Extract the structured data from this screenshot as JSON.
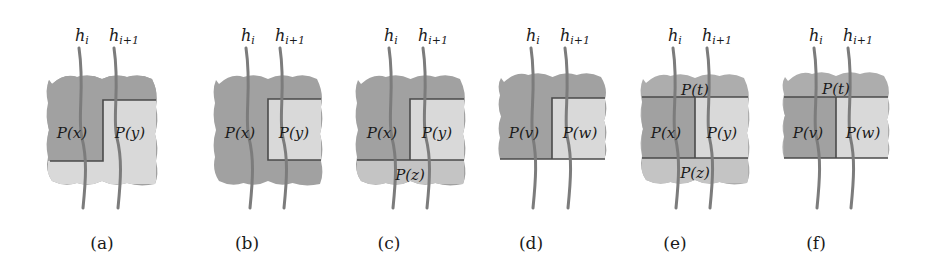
{
  "figure": {
    "colors": {
      "dark_region": "#a1a1a1",
      "mid_region": "#adadad",
      "light_region": "#d9d9d9",
      "lighter_region": "#c4c4c4",
      "boundary_line": "#4a4a4a",
      "curve": "#7c7c7c",
      "text": "#1a1a1a"
    },
    "curve_labels": {
      "left": "h",
      "left_sub": "i",
      "right": "h",
      "right_sub": "i+1"
    },
    "panels": [
      {
        "id": "a",
        "caption": "(a)",
        "cx": 102,
        "blob": {
          "x0": 48,
          "x1": 156,
          "y0": 76,
          "y1": 184,
          "top_wavy": true,
          "bottom_wavy": true
        },
        "regions": [
          {
            "label": "P(x)",
            "shade": "dark",
            "poly": [
              [
                48,
                76
              ],
              [
                156,
                76
              ],
              [
                156,
                100
              ],
              [
                103,
                100
              ],
              [
                103,
                161
              ],
              [
                48,
                161
              ]
            ],
            "text_xy": [
              72,
              133
            ]
          },
          {
            "label": "P(y)",
            "shade": "light",
            "poly": [
              [
                103,
                100
              ],
              [
                156,
                100
              ],
              [
                156,
                184
              ],
              [
                48,
                184
              ],
              [
                48,
                161
              ],
              [
                103,
                161
              ]
            ],
            "text_xy": [
              130,
              133
            ]
          }
        ],
        "lines": [
          [
            [
              50,
              161
            ],
            [
              103,
              161
            ],
            [
              103,
              100
            ],
            [
              156,
              100
            ]
          ]
        ]
      },
      {
        "id": "b",
        "caption": "(b)",
        "cx": 247,
        "blob": {
          "x0": 215,
          "x1": 321,
          "y0": 76,
          "y1": 184,
          "top_wavy": true,
          "bottom_wavy": true
        },
        "regions": [
          {
            "label": "P(x)",
            "shade": "dark",
            "poly": [],
            "text_xy": [
              240,
              133
            ]
          },
          {
            "label": "P(y)",
            "shade": "light",
            "poly": [
              [
                268,
                99
              ],
              [
                321,
                99
              ],
              [
                321,
                160
              ],
              [
                268,
                160
              ]
            ],
            "text_xy": [
              294,
              133
            ]
          }
        ],
        "lines": [
          [
            [
              321,
              99
            ],
            [
              268,
              99
            ],
            [
              268,
              160
            ],
            [
              321,
              160
            ]
          ]
        ]
      },
      {
        "id": "c",
        "caption": "(c)",
        "cx": 389,
        "blob": {
          "x0": 357,
          "x1": 464,
          "y0": 76,
          "y1": 184,
          "top_wavy": true,
          "bottom_wavy": true
        },
        "regions": [
          {
            "label": "P(x)",
            "shade": "dark",
            "poly": [],
            "text_xy": [
              382,
              133
            ]
          },
          {
            "label": "P(y)",
            "shade": "light",
            "poly": [
              [
                410,
                99
              ],
              [
                464,
                99
              ],
              [
                464,
                160
              ],
              [
                410,
                160
              ]
            ],
            "text_xy": [
              437,
              133
            ]
          },
          {
            "label": "P(z)",
            "shade": "lighter",
            "poly": [
              [
                357,
                160
              ],
              [
                464,
                160
              ],
              [
                464,
                184
              ],
              [
                357,
                184
              ]
            ],
            "text_xy": [
              410,
              175
            ]
          }
        ],
        "lines": [
          [
            [
              464,
              99
            ],
            [
              410,
              99
            ],
            [
              410,
              160
            ]
          ],
          [
            [
              357,
              160
            ],
            [
              464,
              160
            ]
          ]
        ]
      },
      {
        "id": "d",
        "caption": "(d)",
        "cx": 531,
        "blob": {
          "x0": 500,
          "x1": 605,
          "y0": 74,
          "y1": 159,
          "top_wavy": true,
          "bottom_wavy": false
        },
        "regions": [
          {
            "label": "P(v)",
            "shade": "dark",
            "poly": [],
            "text_xy": [
              524,
              133
            ]
          },
          {
            "label": "P(w)",
            "shade": "light",
            "poly": [
              [
                552,
                98
              ],
              [
                605,
                98
              ],
              [
                605,
                159
              ],
              [
                552,
                159
              ]
            ],
            "text_xy": [
              580,
              133
            ]
          }
        ],
        "lines": [
          [
            [
              605,
              98
            ],
            [
              552,
              98
            ],
            [
              552,
              159
            ]
          ],
          [
            [
              500,
              159
            ],
            [
              605,
              159
            ]
          ]
        ]
      },
      {
        "id": "e",
        "caption": "(e)",
        "cx": 675,
        "blob": {
          "x0": 642,
          "x1": 748,
          "y0": 75,
          "y1": 183,
          "top_wavy": true,
          "bottom_wavy": true
        },
        "regions": [
          {
            "label": "P(t)",
            "shade": "mid",
            "poly": [],
            "text_xy": [
              695,
              90
            ]
          },
          {
            "label": "P(x)",
            "shade": "dark",
            "poly": [
              [
                642,
                97
              ],
              [
                695,
                97
              ],
              [
                695,
                158
              ],
              [
                642,
                158
              ]
            ],
            "text_xy": [
              666,
              133
            ]
          },
          {
            "label": "P(y)",
            "shade": "light",
            "poly": [
              [
                695,
                97
              ],
              [
                748,
                97
              ],
              [
                748,
                158
              ],
              [
                695,
                158
              ]
            ],
            "text_xy": [
              722,
              133
            ]
          },
          {
            "label": "P(z)",
            "shade": "lighter",
            "poly": [
              [
                642,
                158
              ],
              [
                748,
                158
              ],
              [
                748,
                183
              ],
              [
                642,
                183
              ]
            ],
            "text_xy": [
              695,
              173
            ]
          }
        ],
        "lines": [
          [
            [
              642,
              97
            ],
            [
              748,
              97
            ]
          ],
          [
            [
              695,
              97
            ],
            [
              695,
              158
            ]
          ],
          [
            [
              642,
              158
            ],
            [
              748,
              158
            ]
          ]
        ]
      },
      {
        "id": "f",
        "caption": "(f)",
        "cx": 816,
        "blob": {
          "x0": 784,
          "x1": 888,
          "y0": 73,
          "y1": 158,
          "top_wavy": true,
          "bottom_wavy": false
        },
        "regions": [
          {
            "label": "P(t)",
            "shade": "mid",
            "poly": [],
            "text_xy": [
              836,
              89
            ]
          },
          {
            "label": "P(v)",
            "shade": "dark",
            "poly": [
              [
                784,
                97
              ],
              [
                836,
                97
              ],
              [
                836,
                158
              ],
              [
                784,
                158
              ]
            ],
            "text_xy": [
              808,
              133
            ]
          },
          {
            "label": "P(w)",
            "shade": "light",
            "poly": [
              [
                836,
                97
              ],
              [
                888,
                97
              ],
              [
                888,
                158
              ],
              [
                836,
                158
              ]
            ],
            "text_xy": [
              863,
              133
            ]
          }
        ],
        "lines": [
          [
            [
              784,
              97
            ],
            [
              888,
              97
            ]
          ],
          [
            [
              836,
              97
            ],
            [
              836,
              158
            ]
          ],
          [
            [
              784,
              158
            ],
            [
              888,
              158
            ]
          ]
        ]
      }
    ],
    "curves": [
      {
        "panel": "a",
        "x_top": 79,
        "x_bot": 83,
        "label_x": 80,
        "which": "left"
      },
      {
        "panel": "a",
        "x_top": 114,
        "x_bot": 118,
        "label_x": 114,
        "which": "right"
      },
      {
        "panel": "b",
        "x_top": 246,
        "x_bot": 250,
        "label_x": 246,
        "which": "left"
      },
      {
        "panel": "b",
        "x_top": 280,
        "x_bot": 284,
        "label_x": 280,
        "which": "right"
      },
      {
        "panel": "c",
        "x_top": 389,
        "x_bot": 393,
        "label_x": 389,
        "which": "left"
      },
      {
        "panel": "c",
        "x_top": 423,
        "x_bot": 427,
        "label_x": 423,
        "which": "right"
      },
      {
        "panel": "d",
        "x_top": 531,
        "x_bot": 533,
        "label_x": 531,
        "which": "left"
      },
      {
        "panel": "d",
        "x_top": 565,
        "x_bot": 568,
        "label_x": 565,
        "which": "right"
      },
      {
        "panel": "e",
        "x_top": 673,
        "x_bot": 676,
        "label_x": 673,
        "which": "left"
      },
      {
        "panel": "e",
        "x_top": 707,
        "x_bot": 710,
        "label_x": 707,
        "which": "right"
      },
      {
        "panel": "f",
        "x_top": 814,
        "x_bot": 817,
        "label_x": 814,
        "which": "left"
      },
      {
        "panel": "f",
        "x_top": 848,
        "x_bot": 851,
        "label_x": 848,
        "which": "right"
      }
    ]
  }
}
